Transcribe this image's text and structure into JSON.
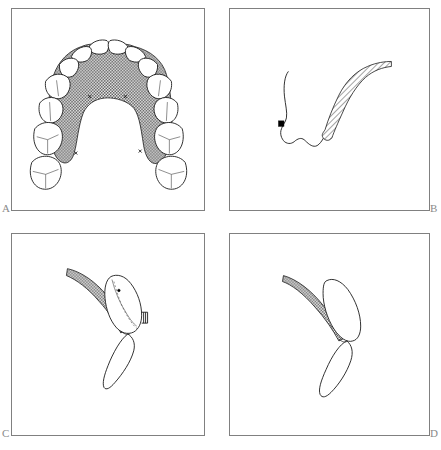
{
  "figure": {
    "background_color": "#ffffff",
    "border_color": "#808080",
    "ink_color": "#1a1a1a",
    "label_color": "#8a8a8a",
    "width": 441,
    "height": 450
  },
  "panels": [
    {
      "id": "a",
      "label": "A",
      "label_position": "bottom-left",
      "caption": "Occlusal view of maxillary dental arch with stippled palate",
      "content_kind": "occlusal-arch-diagram",
      "features": [
        "four incisor outlines at anterior arch",
        "canine and premolar outlines bilaterally",
        "molar outlines with occlusal fissure lines bilaterally",
        "stippled palatal vault region",
        "horseshoe shaped arch form"
      ]
    },
    {
      "id": "b",
      "label": "B",
      "label_position": "bottom-right",
      "caption": "Sagittal profile outline with stippled band and point marker",
      "content_kind": "sagittal-profile",
      "features": [
        "soft tissue profile curve",
        "stippled tapered band",
        "black square landmark marker"
      ]
    },
    {
      "id": "c",
      "label": "C",
      "label_position": "bottom-left",
      "caption": "Sagittal section with stippled band, tooth outline and dashed internal contour",
      "content_kind": "sagittal-section",
      "features": [
        "stippled curved band",
        "upper tooth outline with dashed internal contour",
        "lower tooth outline",
        "small bracket attachment mark",
        "point marker inside upper tooth"
      ]
    },
    {
      "id": "d",
      "label": "D",
      "label_position": "bottom-right",
      "caption": "Sagittal section with stippled band and two tooth outlines",
      "content_kind": "sagittal-section",
      "features": [
        "stippled curved band",
        "upper tooth outline",
        "lower tooth outline"
      ]
    }
  ]
}
